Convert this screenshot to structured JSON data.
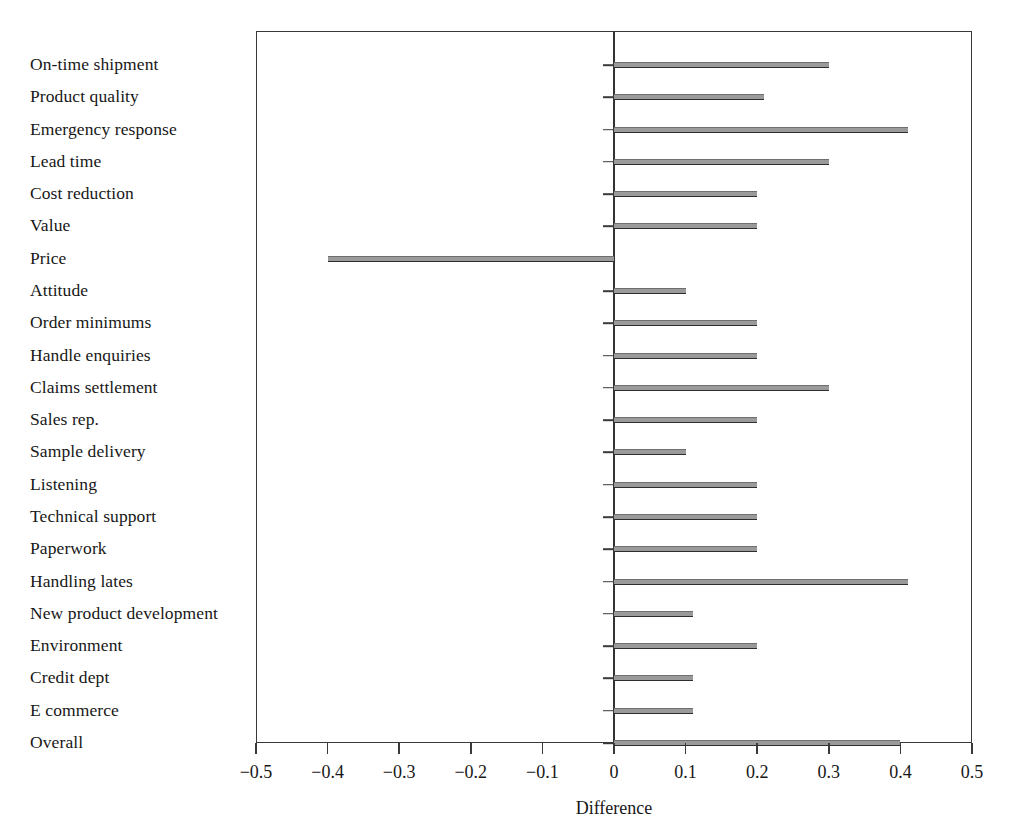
{
  "chart_data": {
    "type": "bar",
    "orientation": "horizontal",
    "title": "",
    "xlabel": "Difference",
    "ylabel": "",
    "xlim": [
      -0.5,
      0.5
    ],
    "xticks": [
      -0.5,
      -0.4,
      -0.3,
      -0.2,
      -0.1,
      0,
      0.1,
      0.2,
      0.3,
      0.4,
      0.5
    ],
    "xtick_labels": [
      "−0.5",
      "−0.4",
      "−0.3",
      "−0.2",
      "−0.1",
      "0",
      "0.1",
      "0.2",
      "0.3",
      "0.4",
      "0.5"
    ],
    "grid": false,
    "legend": null,
    "zero_reference_line": 0,
    "bar_color": "#9a9a9a",
    "bar_edge_color": "#2e2e2e",
    "frame_color": "#3a3a3a",
    "categories": [
      "On-time shipment",
      "Product quality",
      "Emergency response",
      "Lead time",
      "Cost reduction",
      "Value",
      "Price",
      "Attitude",
      "Order minimums",
      "Handle enquiries",
      "Claims settlement",
      "Sales rep.",
      "Sample delivery",
      "Listening",
      "Technical support",
      "Paperwork",
      "Handling lates",
      "New product development",
      "Environment",
      "Credit dept",
      "E commerce",
      "Overall"
    ],
    "values": [
      0.3,
      0.21,
      0.41,
      0.3,
      0.2,
      0.2,
      -0.4,
      0.1,
      0.2,
      0.2,
      0.3,
      0.2,
      0.1,
      0.2,
      0.2,
      0.2,
      0.41,
      0.11,
      0.2,
      0.11,
      0.11,
      0.4
    ]
  }
}
